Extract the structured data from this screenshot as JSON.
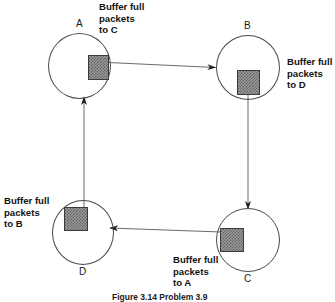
{
  "figure": {
    "caption": "Figure 3.14  Problem 3.9",
    "nodes": [
      {
        "id": "A",
        "label": "A",
        "buffer_text_lines": [
          "Buffer full",
          "packets",
          "to C"
        ]
      },
      {
        "id": "B",
        "label": "B",
        "buffer_text_lines": [
          "Buffer full",
          "packets",
          "to D"
        ]
      },
      {
        "id": "C",
        "label": "C",
        "buffer_text_lines": [
          "Buffer full",
          "packets",
          "to A"
        ]
      },
      {
        "id": "D",
        "label": "D",
        "buffer_text_lines": [
          "Buffer full",
          "packets",
          "to B"
        ]
      }
    ],
    "edges": [
      {
        "from": "A",
        "to": "B",
        "direction": "right"
      },
      {
        "from": "B",
        "to": "C",
        "direction": "down"
      },
      {
        "from": "C",
        "to": "D",
        "direction": "left"
      },
      {
        "from": "D",
        "to": "A",
        "direction": "up"
      }
    ],
    "labels": {
      "node_a": "A",
      "node_b": "B",
      "node_c": "C",
      "node_d": "D",
      "buffer_a_l1": "Buffer full",
      "buffer_a_l2": "packets",
      "buffer_a_l3": "to C",
      "buffer_b_l1": "Buffer full",
      "buffer_b_l2": "packets",
      "buffer_b_l3": "to D",
      "buffer_c_l1": "Buffer full",
      "buffer_c_l2": "packets",
      "buffer_c_l3": "to A",
      "buffer_d_l1": "Buffer full",
      "buffer_d_l2": "packets",
      "buffer_d_l3": "to B"
    },
    "colors": {
      "stroke": "#4a4a4a",
      "buffer_fill": "#9a9a9a",
      "text": "#131313"
    }
  }
}
